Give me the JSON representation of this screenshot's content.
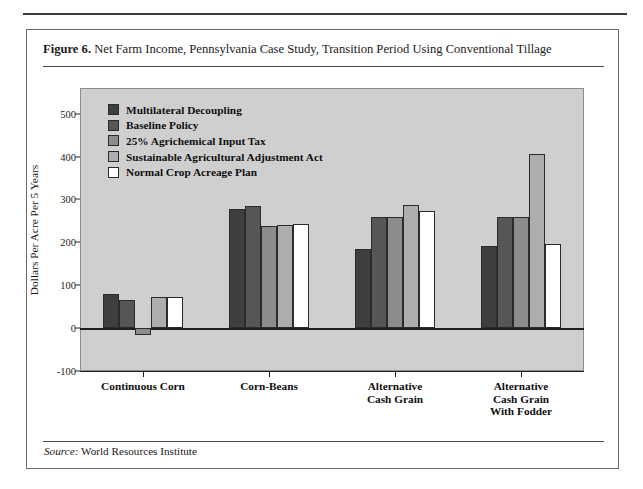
{
  "figure": {
    "number_label": "Figure 6.",
    "title": "Net Farm Income, Pennsylvania Case Study, Transition Period Using Conventional Tillage",
    "source_label": "Source:",
    "source_text": "World Resources Institute"
  },
  "chart_data": {
    "type": "bar",
    "title": "Net Farm Income, Pennsylvania Case Study, Transition Period Using Conventional Tillage",
    "xlabel": "",
    "ylabel": "Dollars Per Acre Per 5 Years",
    "ylim": [
      -100,
      560
    ],
    "yticks": [
      -100,
      0,
      100,
      200,
      300,
      400,
      500
    ],
    "ytick_labels": [
      "-100",
      "0",
      "100",
      "200",
      "300",
      "400",
      "500"
    ],
    "grid": false,
    "legend_position": "upper-left-inside",
    "categories": [
      "Continuous Corn",
      "Corn-Beans",
      "Alternative\nCash Grain",
      "Alternative\nCash Grain\nWith Fodder"
    ],
    "series": [
      {
        "name": "Multilateral Decoupling",
        "color": "#3f3f3f",
        "values": [
          80,
          277,
          185,
          192
        ]
      },
      {
        "name": "Baseline Policy",
        "color": "#565656",
        "values": [
          65,
          285,
          258,
          260
        ]
      },
      {
        "name": "25%  Agrichemical Input Tax",
        "color": "#8c8c8c",
        "values": [
          -15,
          238,
          259,
          260
        ]
      },
      {
        "name": "Sustainable Agricultural Adjustment Act",
        "color": "#adadad",
        "values": [
          72,
          240,
          288,
          405
        ]
      },
      {
        "name": "Normal Crop Acreage Plan",
        "color": "#ffffff",
        "values": [
          72,
          242,
          272,
          196
        ]
      }
    ],
    "plot_background": "#cfcfcf"
  },
  "xcat_lines": [
    [
      "Continuous Corn"
    ],
    [
      "Corn-Beans"
    ],
    [
      "Alternative",
      "Cash Grain"
    ],
    [
      "Alternative",
      "Cash Grain",
      "With Fodder"
    ]
  ]
}
